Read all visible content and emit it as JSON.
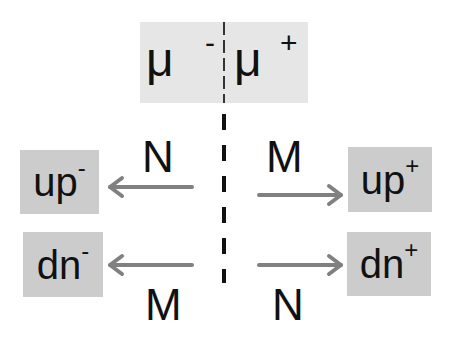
{
  "top_box": {
    "left_symbol": "μ",
    "left_sign": "-",
    "right_symbol": "μ",
    "right_sign": "+"
  },
  "boxes": {
    "up_minus": {
      "base": "up",
      "sign": "-"
    },
    "dn_minus": {
      "base": "dn",
      "sign": "-"
    },
    "up_plus": {
      "base": "up",
      "sign": "+"
    },
    "dn_plus": {
      "base": "dn",
      "sign": "+"
    }
  },
  "arrow_labels": {
    "upper_left": "N",
    "upper_right": "M",
    "lower_left": "M",
    "lower_right": "N"
  },
  "colors": {
    "box_fill": "#cccccc",
    "top_box_fill": "#e6e6e6",
    "arrow": "#808080",
    "dash": "#111111"
  }
}
